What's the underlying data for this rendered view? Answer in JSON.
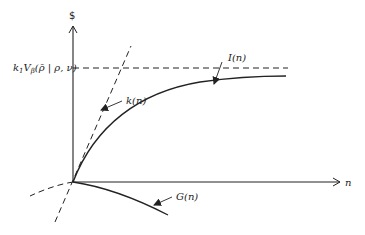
{
  "diagram": {
    "axes": {
      "y_label": "$",
      "x_label": "n"
    },
    "asymptote_label": {
      "k": "k",
      "k_sub": "1",
      "V": "V",
      "V_sub": "β",
      "args": "(ρ̄ | ρ, ν)"
    },
    "curves": [
      {
        "name": "I(n)",
        "label": "I(n)",
        "style": "solid",
        "description": "concave increasing curve approaching asymptote"
      },
      {
        "name": "k(n)",
        "label": "k(n)",
        "style": "dashed",
        "description": "straight dashed line through origin"
      },
      {
        "name": "G(n)",
        "label": "G(n)",
        "style": "solid",
        "description": "decreasing curve below n-axis"
      }
    ],
    "asymptote_style": "dashed horizontal",
    "colors": {
      "line": "#222222",
      "background": "#ffffff"
    }
  }
}
